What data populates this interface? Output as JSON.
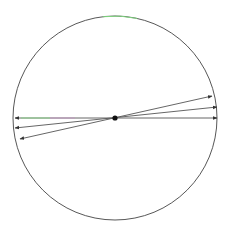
{
  "diagram": {
    "type": "circle-with-diameters",
    "background": "#ffffff",
    "circle": {
      "cx": 115,
      "cy": 118,
      "r": 102,
      "stroke": "#444444",
      "highlight_arc_color": "#7fd67f",
      "highlight_arc_color2": "#6a5acd"
    },
    "center_point": {
      "cx": 115,
      "cy": 118,
      "r": 2.6,
      "fill": "#111111"
    },
    "diameters": [
      {
        "name": "horizontal-diameter",
        "x1": 15,
        "y1": 118,
        "x2": 217,
        "y2": 118,
        "color": "#555555",
        "accent_left": "#86d686",
        "accent_mid": "#c58fc5"
      },
      {
        "name": "slight-tilt-diameter",
        "x1": 15,
        "y1": 128,
        "x2": 217,
        "y2": 107,
        "color": "#555555"
      },
      {
        "name": "steeper-tilt-diameter",
        "x1": 20,
        "y1": 139,
        "x2": 212,
        "y2": 96,
        "color": "#555555"
      }
    ]
  }
}
